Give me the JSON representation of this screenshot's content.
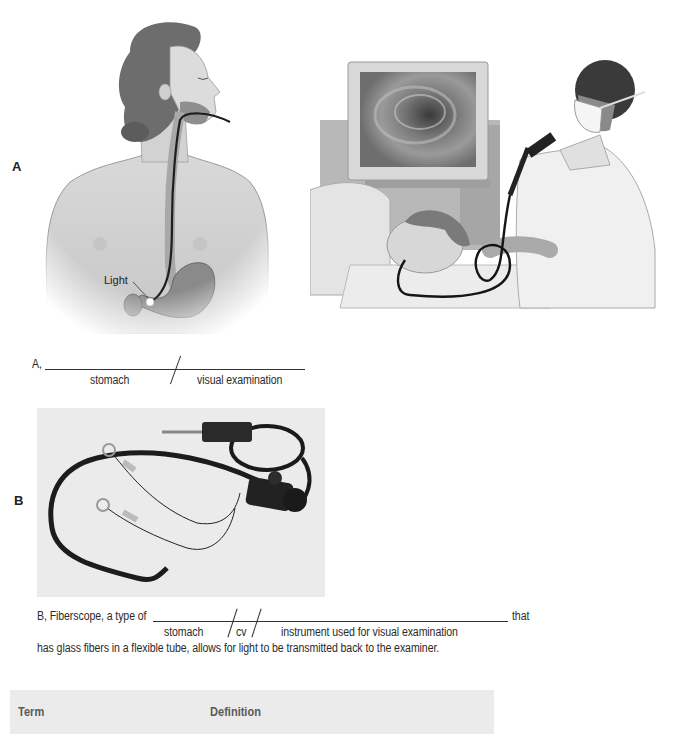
{
  "figure_a": {
    "label": "A",
    "illustration_left": {
      "description": "Front-view anatomical illustration of a woman with an endoscope passing through mouth and esophagus into the stomach",
      "callout": "Light"
    },
    "illustration_right": {
      "description": "Physician in mask performing a gastroscopy on a patient lying on her side, with monitor showing interior view"
    },
    "fill_in": {
      "prefix": "A,",
      "parts": [
        "stomach",
        "visual examination"
      ]
    }
  },
  "figure_b": {
    "label": "B",
    "photo": {
      "description": "Photograph of a flexible fiberscope (endoscope) with instruments"
    },
    "fill_in": {
      "prefix": "B, Fiberscope, a type of",
      "suffix": "that",
      "parts": [
        "stomach",
        "cv",
        "instrument used for visual examination"
      ],
      "continuation": "has glass fibers in a flexible tube, allows for light to be transmitted back to the examiner."
    }
  },
  "table": {
    "columns": [
      "Term",
      "Definition"
    ],
    "header_bg": "#ebebeb"
  }
}
